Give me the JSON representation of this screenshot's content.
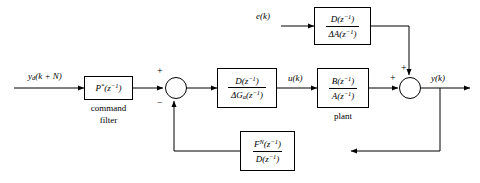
{
  "diagram": {
    "stroke_color": "#000000",
    "background": "#ffffff",
    "signals": {
      "reference": "y_d(k+N)",
      "reference_html": "y<sub>d</sub>(k + N)",
      "control": "u(k)",
      "output": "y(k)",
      "disturbance": "e(k)"
    },
    "blocks": [
      {
        "id": "command-filter",
        "numerator": "P*(z⁻¹)",
        "numerator_html": "P<sup>*</sup>(z<sup>−1</sup>)",
        "denominator": "",
        "caption_line1": "command",
        "caption_line2": "filter",
        "single_line": true
      },
      {
        "id": "controller",
        "numerator": "D(z⁻¹)",
        "numerator_html": "D(z<sup>−1</sup>)",
        "denominator": "ΔG_a(z⁻¹)",
        "denominator_html": "ΔG<sub>a</sub>(z<sup>−1</sup>)",
        "caption_line1": "",
        "caption_line2": "",
        "single_line": false
      },
      {
        "id": "plant",
        "numerator": "B(z⁻¹)",
        "numerator_html": "B(z<sup>−1</sup>)",
        "denominator": "A(z⁻¹)",
        "denominator_html": "A(z<sup>−1</sup>)",
        "caption_line1": "plant",
        "caption_line2": "",
        "single_line": false
      },
      {
        "id": "disturbance-filter",
        "numerator": "D(z⁻¹)",
        "numerator_html": "D(z<sup>−1</sup>)",
        "denominator": "ΔA(z⁻¹)",
        "denominator_html": "ΔA(z<sup>−1</sup>)",
        "caption_line1": "",
        "caption_line2": "",
        "single_line": false
      },
      {
        "id": "feedback-filter",
        "numerator": "F^N(z⁻¹)",
        "numerator_html": "F<sup>N</sup>(z<sup>−1</sup>)",
        "denominator": "D(z⁻¹)",
        "denominator_html": "D(z<sup>−1</sup>)",
        "caption_line1": "",
        "caption_line2": "",
        "single_line": false
      }
    ],
    "summing_junctions": [
      {
        "id": "error-summer",
        "sign_top": "+",
        "sign_bottom": "−"
      },
      {
        "id": "output-summer",
        "sign_top": "+",
        "sign_left": "+"
      }
    ]
  }
}
